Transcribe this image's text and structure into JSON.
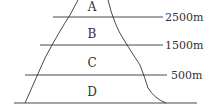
{
  "diagram": {
    "type": "mountain-elevation-zones",
    "zones": [
      {
        "label": "A",
        "x": 92,
        "y": 11
      },
      {
        "label": "B",
        "x": 92,
        "y": 38
      },
      {
        "label": "C",
        "x": 92,
        "y": 67
      },
      {
        "label": "D",
        "x": 92,
        "y": 96
      }
    ],
    "altitudes": [
      {
        "label": "2500m",
        "y": 17,
        "x1": 53,
        "x2": 163,
        "tx": 165
      },
      {
        "label": "1500m",
        "y": 45,
        "x1": 40,
        "x2": 163,
        "tx": 165
      },
      {
        "label": "500m",
        "y": 75,
        "x1": 25,
        "x2": 167,
        "tx": 171
      }
    ],
    "baseline": {
      "y": 103,
      "x1": 14,
      "x2": 197
    },
    "line_color": "#333333"
  }
}
